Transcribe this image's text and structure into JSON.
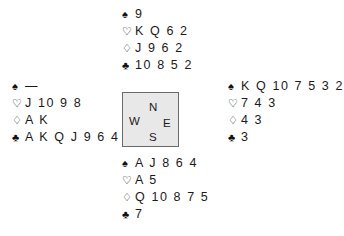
{
  "diagram": {
    "type": "bridge-deal",
    "background_color": "#ffffff",
    "text_color": "#1a1a1a"
  },
  "suits": {
    "spade": {
      "symbol": "♠",
      "name": "spade-symbol"
    },
    "heart": {
      "symbol": "♡",
      "name": "heart-symbol"
    },
    "diamond": {
      "symbol": "♢",
      "name": "diamond-symbol"
    },
    "club": {
      "symbol": "♣",
      "name": "club-symbol"
    }
  },
  "hands": {
    "north": {
      "position_label": "N",
      "spades": "9",
      "hearts": "K Q 6 2",
      "diamonds": "J 9 6 2",
      "clubs": "10 8 5 2"
    },
    "west": {
      "position_label": "W",
      "spades": "—",
      "hearts": "J 10 9 8",
      "diamonds": "A K",
      "clubs": "A K Q J 9 6 4"
    },
    "east": {
      "position_label": "E",
      "spades": "K Q 10 7 5 3 2",
      "hearts": "7 4 3",
      "diamonds": "4 3",
      "clubs": "3"
    },
    "south": {
      "position_label": "S",
      "spades": "A J 8 6 4",
      "hearts": "A 5",
      "diamonds": "Q 10 8 7 5",
      "clubs": "7"
    }
  },
  "compass": {
    "north": "N",
    "west": "W",
    "east": "E",
    "south": "S",
    "fill_color": "#e8e8e8",
    "border_color": "#6b6b6b"
  }
}
